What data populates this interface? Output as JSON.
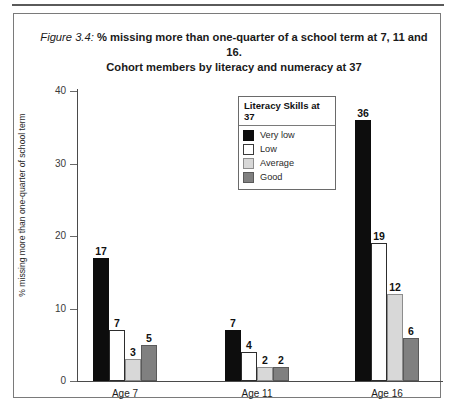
{
  "figure": {
    "number": "Figure 3.4:",
    "title_line1": " % missing more than one-quarter of a school term at 7, 11 and 16.",
    "title_line2": "Cohort members by literacy and numeracy at 37"
  },
  "legend": {
    "title": "Literacy Skills at 37",
    "entries": [
      {
        "label": "Very low",
        "color": "#0d0d0d"
      },
      {
        "label": "Low",
        "color": "#ffffff"
      },
      {
        "label": "Average",
        "color": "#d8d8d8"
      },
      {
        "label": "Good",
        "color": "#808080"
      }
    ]
  },
  "chart_data": {
    "type": "bar",
    "title": "Figure 3.4: % missing more than one-quarter of a school term at 7, 11 and 16. Cohort members by literacy and numeracy at 37",
    "xlabel": "",
    "ylabel": "% missing more than one-quarter of school term",
    "ylim": [
      0,
      40
    ],
    "yticks": [
      0,
      10,
      20,
      30,
      40
    ],
    "ytick_labels": [
      "0",
      "10",
      "20",
      "30",
      "40"
    ],
    "grid": false,
    "legend_position": "upper-center",
    "categories": [
      "Age 7",
      "Age 11",
      "Age 16"
    ],
    "series": [
      {
        "name": "Very low",
        "color": "#0d0d0d",
        "values": [
          17,
          7,
          36
        ]
      },
      {
        "name": "Low",
        "color": "#ffffff",
        "values": [
          7,
          4,
          19
        ]
      },
      {
        "name": "Average",
        "color": "#d8d8d8",
        "values": [
          3,
          2,
          12
        ]
      },
      {
        "name": "Good",
        "color": "#808080",
        "values": [
          5,
          2,
          6
        ]
      }
    ],
    "data_labels": [
      [
        "17",
        "7",
        "3",
        "5"
      ],
      [
        "7",
        "4",
        "2",
        "2"
      ],
      [
        "36",
        "19",
        "12",
        "6"
      ]
    ]
  }
}
